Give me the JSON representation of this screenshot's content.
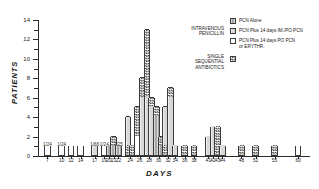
{
  "chart_data": {
    "type": "bar",
    "title": "",
    "xlabel": "DAYS",
    "ylabel": "PATIENTS",
    "ylim": [
      0,
      14
    ],
    "yticks": [
      0,
      2,
      4,
      6,
      8,
      10,
      12,
      14
    ],
    "ytick_labels": [
      "0",
      "2",
      "4",
      "6",
      "8",
      "10",
      "12",
      "14"
    ],
    "grid": false,
    "stacked": true,
    "legend_position": "top-right",
    "series": [
      {
        "name": "PCN Alone",
        "fill": "grey"
      },
      {
        "name": "PCN Plus 14 days IM./PO PCN",
        "fill": "light"
      },
      {
        "name": "PCN Plus 14 days PO PCN or ERYTHR.",
        "fill": "open"
      },
      {
        "name": "SINGLE SEQUENTIAL ANTIBIOTICS",
        "fill": "check"
      }
    ],
    "categories": [
      "7",
      "10",
      "12",
      "14",
      "17",
      "19",
      "20",
      "21",
      "22",
      "24",
      "26",
      "28",
      "30",
      "32",
      "34",
      "36",
      "38",
      "41",
      "42",
      "43",
      "44",
      "48",
      "51",
      "55",
      "60"
    ],
    "bars": [
      {
        "x": "7",
        "total": 1,
        "label": "1/24",
        "segments": [
          {
            "fill": "open",
            "value": 1
          }
        ]
      },
      {
        "x": "10",
        "total": 1,
        "label": "1/24",
        "segments": [
          {
            "fill": "open",
            "value": 1
          }
        ]
      },
      {
        "x": "12",
        "total": 1,
        "label": "",
        "segments": [
          {
            "fill": "open",
            "value": 1
          }
        ]
      },
      {
        "x": "14",
        "total": 1,
        "label": "",
        "segments": [
          {
            "fill": "open",
            "value": 1
          }
        ]
      },
      {
        "x": "17",
        "total": 1,
        "label": "1/66",
        "segments": [
          {
            "fill": "light",
            "value": 1
          }
        ]
      },
      {
        "x": "19",
        "total": 1,
        "label": "1/24",
        "segments": [
          {
            "fill": "open",
            "value": 1
          }
        ]
      },
      {
        "x": "20",
        "total": 1,
        "label": "",
        "segments": [
          {
            "fill": "grey",
            "value": 1
          }
        ]
      },
      {
        "x": "21",
        "total": 2,
        "label": "",
        "segments": [
          {
            "fill": "grey",
            "value": 1
          },
          {
            "fill": "check",
            "value": 1
          }
        ]
      },
      {
        "x": "22",
        "total": 1,
        "label": "1/25",
        "segments": [
          {
            "fill": "grey",
            "value": 1
          }
        ]
      },
      {
        "x": "24",
        "total": 4,
        "label": "",
        "segments": [
          {
            "fill": "check",
            "value": 1
          },
          {
            "fill": "light",
            "value": 3
          }
        ]
      },
      {
        "x": "25",
        "total": 1,
        "label": "",
        "segments": [
          {
            "fill": "check",
            "value": 1
          }
        ]
      },
      {
        "x": "26",
        "total": 5,
        "label": "",
        "segments": [
          {
            "fill": "open",
            "value": 2
          },
          {
            "fill": "check",
            "value": 3
          }
        ]
      },
      {
        "x": "27",
        "total": 8,
        "label": "",
        "segments": [
          {
            "fill": "light",
            "value": 6
          },
          {
            "fill": "check",
            "value": 2
          }
        ]
      },
      {
        "x": "28",
        "total": 13,
        "label": "",
        "segments": [
          {
            "fill": "light",
            "value": 6
          },
          {
            "fill": "check",
            "value": 7
          }
        ]
      },
      {
        "x": "29",
        "total": 6,
        "label": "",
        "segments": [
          {
            "fill": "light",
            "value": 5
          },
          {
            "fill": "check",
            "value": 1
          }
        ]
      },
      {
        "x": "30",
        "total": 5,
        "label": "",
        "segments": [
          {
            "fill": "grey",
            "value": 4
          },
          {
            "fill": "check",
            "value": 1
          }
        ]
      },
      {
        "x": "31",
        "total": 2,
        "label": "",
        "segments": [
          {
            "fill": "grey",
            "value": 1
          },
          {
            "fill": "check",
            "value": 1
          }
        ]
      },
      {
        "x": "32",
        "total": 5,
        "label": "",
        "segments": [
          {
            "fill": "check",
            "value": 1
          },
          {
            "fill": "light",
            "value": 4
          }
        ]
      },
      {
        "x": "33",
        "total": 7,
        "label": "",
        "segments": [
          {
            "fill": "light",
            "value": 6
          },
          {
            "fill": "check",
            "value": 1
          }
        ]
      },
      {
        "x": "34",
        "total": 1,
        "label": "",
        "segments": [
          {
            "fill": "light",
            "value": 1
          }
        ]
      },
      {
        "x": "36",
        "total": 1,
        "label": "",
        "segments": [
          {
            "fill": "check",
            "value": 1
          }
        ]
      },
      {
        "x": "38",
        "total": 1,
        "label": "",
        "segments": [
          {
            "fill": "check",
            "value": 1
          }
        ]
      },
      {
        "x": "41",
        "total": 2,
        "label": "",
        "segments": [
          {
            "fill": "light",
            "value": 2
          }
        ]
      },
      {
        "x": "42",
        "total": 3,
        "label": "",
        "segments": [
          {
            "fill": "light",
            "value": 3
          }
        ]
      },
      {
        "x": "43",
        "total": 3,
        "label": "",
        "segments": [
          {
            "fill": "check",
            "value": 3
          }
        ]
      },
      {
        "x": "44",
        "total": 1,
        "label": "",
        "segments": [
          {
            "fill": "light",
            "value": 1
          }
        ]
      },
      {
        "x": "48",
        "total": 1,
        "label": "",
        "segments": [
          {
            "fill": "check",
            "value": 1
          }
        ]
      },
      {
        "x": "51",
        "total": 1,
        "label": "",
        "segments": [
          {
            "fill": "check",
            "value": 1
          }
        ]
      },
      {
        "x": "55",
        "total": 1,
        "label": "",
        "segments": [
          {
            "fill": "check",
            "value": 1
          }
        ]
      },
      {
        "x": "60",
        "total": 1,
        "label": "",
        "segments": [
          {
            "fill": "open",
            "value": 1
          }
        ]
      }
    ],
    "xtick_groups": [
      {
        "label": "7",
        "center": 7
      },
      {
        "label": "10",
        "center": 10
      },
      {
        "label": "12",
        "center": 12
      },
      {
        "label": "14",
        "center": 14
      },
      {
        "label": "17",
        "center": 17
      },
      {
        "label": "19",
        "center": 19
      },
      {
        "label": "20",
        "center": 20
      },
      {
        "label": "21",
        "center": 21
      },
      {
        "label": "22",
        "center": 22
      },
      {
        "label": "24",
        "center": 24.5
      },
      {
        "label": "26",
        "center": 26.5
      },
      {
        "label": "28",
        "center": 28.5
      },
      {
        "label": "30",
        "center": 30.5
      },
      {
        "label": "32",
        "center": 32.5
      },
      {
        "label": "34",
        "center": 34
      },
      {
        "label": "36",
        "center": 36
      },
      {
        "label": "38",
        "center": 38
      },
      {
        "label": "41",
        "center": 41
      },
      {
        "label": "42",
        "center": 42
      },
      {
        "label": "43",
        "center": 43
      },
      {
        "label": "44",
        "center": 44
      },
      {
        "label": "48",
        "center": 48
      },
      {
        "label": "51",
        "center": 51
      },
      {
        "label": "55",
        "center": 55
      },
      {
        "label": "60",
        "center": 60
      }
    ]
  },
  "axes": {
    "ylabel": "PATIENTS",
    "xlabel": "DAYS",
    "ytick_labels": [
      "0",
      "2",
      "4",
      "6",
      "8",
      "10",
      "12",
      "14"
    ]
  },
  "legend": {
    "group_iv_label": "INTRAVENOUS\nPENICILLIN",
    "group_single_label": "SINGLE\nSEQUENTIAL\nANTIBIOTICS",
    "items": [
      {
        "label": "PCN Alone",
        "fill": "grey"
      },
      {
        "label": "PCN Plus 14 days IM./PO PCN",
        "fill": "light"
      },
      {
        "label": "PCN Plus 14 days PO PCN\nor ERYTHR.",
        "fill": "open"
      },
      {
        "label": "",
        "fill": "check"
      }
    ]
  }
}
